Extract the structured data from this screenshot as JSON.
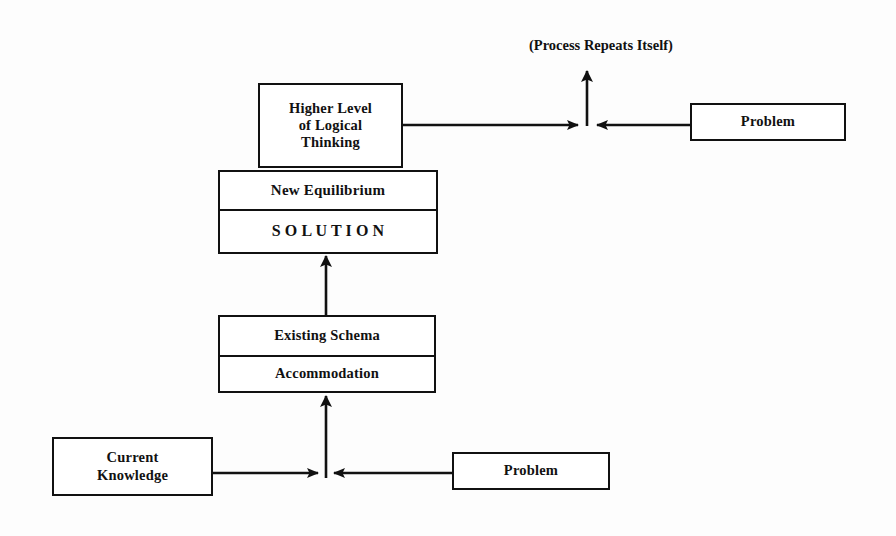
{
  "diagram": {
    "background_color": "#fdfdfd",
    "line_color": "#111111",
    "nodes": {
      "higher_level": {
        "label": "Higher Level\nof Logical\nThinking"
      },
      "equilibrium": {
        "top_label": "New Equilibrium",
        "bottom_label": "S O L U T I O N"
      },
      "schema": {
        "top_label": "Existing Schema",
        "bottom_label": "Accommodation"
      },
      "current_knowledge": {
        "label": "Current\nKnowledge"
      },
      "problem_bottom": {
        "label": "Problem"
      },
      "problem_top": {
        "label": "Problem"
      }
    },
    "captions": {
      "process_repeats": "(Process Repeats Itself)"
    },
    "connectors": [
      {
        "name": "current-knowledge-to-bottom-junction",
        "from": "Current Knowledge",
        "to": "bottom junction",
        "direction": "right",
        "arrowhead": true
      },
      {
        "name": "problem-bottom-to-bottom-junction",
        "from": "Problem",
        "to": "bottom junction",
        "direction": "left",
        "arrowhead": true
      },
      {
        "name": "bottom-junction-to-accommodation",
        "from": "bottom junction",
        "to": "Accommodation",
        "direction": "up",
        "arrowhead": true
      },
      {
        "name": "existing-schema-to-solution",
        "from": "Existing Schema",
        "to": "SOLUTION",
        "direction": "up",
        "arrowhead": true
      },
      {
        "name": "higher-level-to-top-junction",
        "from": "Higher Level of Logical Thinking",
        "to": "top junction",
        "direction": "right",
        "arrowhead": true
      },
      {
        "name": "problem-top-to-top-junction",
        "from": "Problem",
        "to": "top junction",
        "direction": "left",
        "arrowhead": true
      },
      {
        "name": "top-junction-to-process-repeats",
        "from": "top junction",
        "to": "(Process Repeats Itself)",
        "direction": "up",
        "arrowhead": true
      }
    ]
  }
}
